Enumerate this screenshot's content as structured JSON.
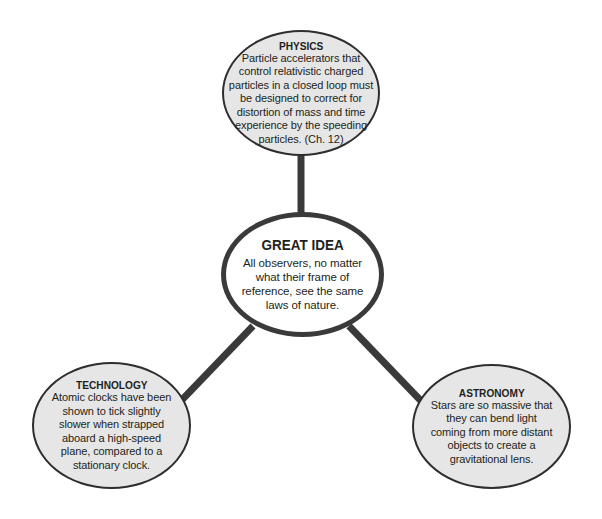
{
  "diagram": {
    "type": "concept-map",
    "colors": {
      "outer_node_fill": "#e6e6e6",
      "center_node_fill": "#ffffff",
      "border": "#2e2e2e",
      "connector": "#3a3a3a",
      "text": "#231f20"
    },
    "center": {
      "title": "GREAT IDEA",
      "body": "All observers, no matter what their frame of reference, see the same laws of nature."
    },
    "nodes": [
      {
        "id": "physics",
        "title": "PHYSICS",
        "body": "Particle accelerators that control relativistic charged particles in a closed loop must be designed to correct for distortion of mass and time experience by the speeding particles. (Ch. 12)"
      },
      {
        "id": "technology",
        "title": "TECHNOLOGY",
        "body": "Atomic clocks have been shown to tick slightly slower when strapped aboard a high-speed plane, compared to a stationary clock."
      },
      {
        "id": "astronomy",
        "title": "ASTRONOMY",
        "body": "Stars are so massive that they can bend light coming from more distant objects to create a gravitational lens."
      }
    ],
    "edges": [
      {
        "from": "center",
        "to": "physics"
      },
      {
        "from": "center",
        "to": "technology"
      },
      {
        "from": "center",
        "to": "astronomy"
      }
    ]
  }
}
